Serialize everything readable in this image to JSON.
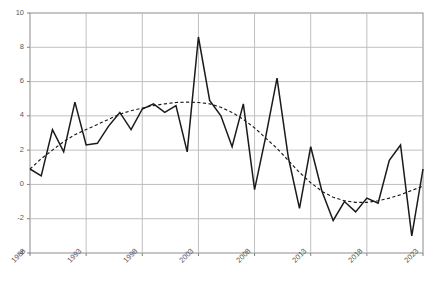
{
  "chart_data": {
    "type": "line",
    "title": "",
    "subtitle": "",
    "xlabel": "",
    "ylabel": "",
    "grid": true,
    "legend": "none",
    "xlim": [
      1988,
      2023
    ],
    "ylim": [
      -4,
      10
    ],
    "yticks": [
      -4,
      -2,
      0,
      2,
      4,
      6,
      8,
      10
    ],
    "ytick_labels": [
      "-4",
      "-2",
      "0",
      "2",
      "4",
      "6",
      "8",
      "10"
    ],
    "xticks": [
      1988,
      1993,
      1998,
      2003,
      2008,
      2013,
      2018,
      2023
    ],
    "xtick_labels": [
      "1988",
      "1993",
      "1998",
      "2003",
      "2008",
      "2013",
      "2018",
      "2023"
    ],
    "x": [
      1988,
      1989,
      1990,
      1991,
      1992,
      1993,
      1994,
      1995,
      1996,
      1997,
      1998,
      1999,
      2000,
      2001,
      2002,
      2003,
      2004,
      2005,
      2006,
      2007,
      2008,
      2009,
      2010,
      2011,
      2012,
      2013,
      2014,
      2015,
      2016,
      2017,
      2018,
      2019,
      2020,
      2021,
      2022,
      2023
    ],
    "series": [
      {
        "name": "Annual series",
        "style": "solid",
        "color": "#1a1a1a",
        "values": [
          0.9,
          0.5,
          3.2,
          1.9,
          4.8,
          2.3,
          2.4,
          3.4,
          4.2,
          3.2,
          4.4,
          4.7,
          4.2,
          4.6,
          1.9,
          8.6,
          4.9,
          4.0,
          2.2,
          4.7,
          -0.3,
          2.8,
          6.2,
          1.6,
          -1.4,
          2.2,
          -0.4,
          -2.1,
          -1.0,
          -1.6,
          -0.8,
          -1.1,
          1.4,
          2.3,
          -3.0,
          0.9
        ]
      },
      {
        "name": "Polynomial trend",
        "style": "dashed",
        "color": "#1a1a1a",
        "values": [
          0.9,
          1.5,
          2.0,
          2.5,
          2.9,
          3.2,
          3.5,
          3.8,
          4.1,
          4.3,
          4.45,
          4.6,
          4.7,
          4.78,
          4.8,
          4.78,
          4.7,
          4.5,
          4.2,
          3.8,
          3.3,
          2.7,
          2.1,
          1.4,
          0.7,
          0.1,
          -0.4,
          -0.75,
          -0.95,
          -1.05,
          -1.05,
          -0.95,
          -0.8,
          -0.6,
          -0.35,
          -0.1
        ]
      }
    ]
  },
  "axes": {
    "frame_color": "#808080",
    "grid_color": "#bfbfbf",
    "tick_text_color": "#595959"
  }
}
